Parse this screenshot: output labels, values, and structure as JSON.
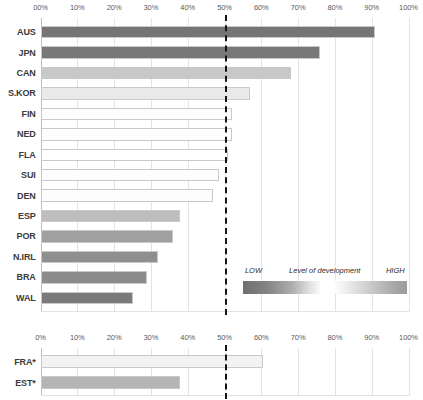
{
  "chart_data": {
    "type": "bar",
    "title": "",
    "subtitle": "",
    "xlabel": "",
    "ylabel": "",
    "orientation": "horizontal",
    "xlim": [
      0,
      100
    ],
    "grid": true,
    "threshold": {
      "value": 50,
      "style": "dashed",
      "color": "#141414"
    },
    "panels": [
      {
        "name": "main-panel",
        "tick_labels": [
          "00%",
          "10%",
          "20%",
          "30%",
          "40%",
          "50%",
          "60%",
          "70%",
          "80%",
          "90%",
          "100%"
        ],
        "tick_values": [
          0,
          10,
          20,
          30,
          40,
          50,
          60,
          70,
          80,
          90,
          100
        ],
        "categories": [
          "AUS",
          "JPN",
          "CAN",
          "S.KOR",
          "FIN",
          "NED",
          "FLA",
          "SUI",
          "DEN",
          "ESP",
          "POR",
          "N.IRL",
          "BRA",
          "WAL"
        ],
        "values": [
          91,
          76,
          68,
          57,
          52,
          52,
          51,
          48.5,
          47,
          38,
          36,
          32,
          29,
          25
        ],
        "colors": [
          "#757575",
          "#787878",
          "#c8c8c8",
          "#e9e9e9",
          "#fdfdfd",
          "#fefefe",
          "#ffffff",
          "#fdfdfd",
          "#fdfdfd",
          "#bdbdbd",
          "#a0a0a0",
          "#8f8f8f",
          "#8c8c8c",
          "#7a7a7a"
        ]
      },
      {
        "name": "secondary-panel",
        "tick_labels": [
          "0%",
          "10%",
          "20%",
          "30%",
          "40%",
          "50%",
          "60%",
          "70%",
          "80%",
          "90%",
          "100%"
        ],
        "tick_values": [
          0,
          10,
          20,
          30,
          40,
          50,
          60,
          70,
          80,
          90,
          100
        ],
        "categories": [
          "FRA*",
          "EST*"
        ],
        "values": [
          60.5,
          38
        ],
        "colors": [
          "#f2f2f2",
          "#b5b5b5"
        ]
      }
    ],
    "legend": {
      "position": "inside-right",
      "low_label": "LOW",
      "mid_label": "Level of development",
      "high_label": "HIGH",
      "gradient_from": "#6f6f6f",
      "gradient_mid": "#ffffff",
      "gradient_to": "#9b9b9b"
    }
  }
}
